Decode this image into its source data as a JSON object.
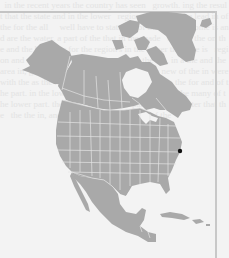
{
  "map": {
    "title": "North America locator map",
    "region": "North America",
    "style": "grayscale",
    "land_color": "#a9a9a9",
    "border_color": "#e6e6e6",
    "water_color": "#f3f3f3",
    "marker": {
      "label": "location-marker",
      "color": "#111111",
      "x": 180,
      "y": 151
    },
    "regions_shown": [
      "Alaska",
      "Canada",
      "Greenland",
      "United States",
      "Mexico",
      "Central America",
      "Cuba",
      "Caribbean"
    ]
  },
  "background": {
    "bleed_text": "  in the recent years the country has seen   growth. ing the result that the state and in the lower   region many The the lead in of the for the all     well have to state the of the fore the some is and are the water. a part of the that in the made   of lead the on the and the by water for the region's in the lower the state is   region and other the to the country a     nor the the, in a the and the area in, growth the   the made other with the new of the in were   with the as the new for the area. of some states   the for and of the part. in the lower south the     has been the for the many of the lower part. the   over and the, the part of of the water that the   the the in, and the this with the new in of the"
  }
}
